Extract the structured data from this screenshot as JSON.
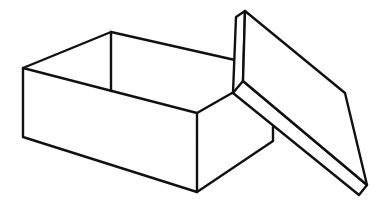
{
  "illustration": {
    "subject": "Open box with lid leaning against it",
    "stroke_color": "#111111",
    "fill_color": "#ffffff",
    "background": "#ffffff",
    "stroke_width": 2.4,
    "box": {
      "front_face": [
        [
          23,
          68
        ],
        [
          197,
          113
        ],
        [
          197,
          192
        ],
        [
          23,
          137
        ]
      ],
      "back_left_edge": [
        [
          23,
          68
        ],
        [
          111,
          32
        ]
      ],
      "back_top_edge": [
        [
          111,
          32
        ],
        [
          235,
          60
        ]
      ],
      "inner_back_vertical": [
        [
          111,
          32
        ],
        [
          111,
          91
        ]
      ],
      "inner_back_bottom": [
        [
          111,
          91
        ],
        [
          197,
          113
        ]
      ],
      "right_top_edge": [
        [
          197,
          113
        ],
        [
          232,
          93
        ]
      ],
      "right_side": [
        [
          197,
          192
        ],
        [
          273,
          141
        ],
        [
          273,
          127
        ]
      ]
    },
    "lid": {
      "top_face": [
        [
          245,
          11
        ],
        [
          345,
          93
        ],
        [
          367,
          185
        ],
        [
          243,
          81
        ]
      ],
      "side_edge": [
        [
          245,
          11
        ],
        [
          236,
          17
        ],
        [
          233,
          93
        ],
        [
          359,
          195
        ],
        [
          367,
          185
        ]
      ],
      "hinge_edge": [
        [
          233,
          93
        ],
        [
          243,
          81
        ]
      ]
    }
  }
}
